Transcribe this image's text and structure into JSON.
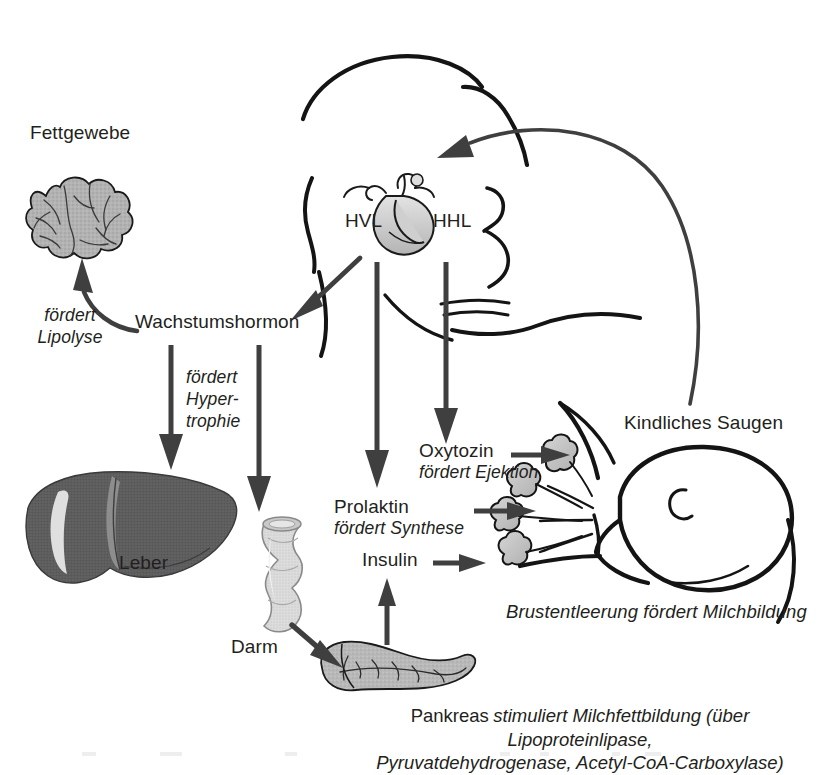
{
  "figure": {
    "kind": "physiology-flow-diagram",
    "language": "de",
    "background_color": "#ffffff",
    "ink_color": "#1a1a1a",
    "arrow_color": "#3f3f3f",
    "fill_light_gray": "#cfcfcf",
    "fill_mid_gray": "#a8a8a8",
    "fill_dark_gray": "#5a5a5a"
  },
  "nodes": {
    "fettgewebe": "Fettgewebe",
    "wachstumshormon": "Wachstumshormon",
    "leber": "Leber",
    "darm": "Darm",
    "pankreas": "Pankreas",
    "insulin": "Insulin",
    "prolaktin": "Prolaktin",
    "oxytozin": "Oxytozin",
    "hvl": "HVL",
    "hhl": "HHL",
    "kindliches_saugen": "Kindliches Saugen"
  },
  "annotations": {
    "foerdert_lipolyse_line1": "fördert",
    "foerdert_lipolyse_line2": "Lipolyse",
    "foerdert_hypertrophie_line1": "fördert",
    "foerdert_hypertrophie_line2": "Hyper-",
    "foerdert_hypertrophie_line3": "trophie",
    "foerdert_ejektion": "fördert Ejektion",
    "foerdert_synthese": "fördert Synthese",
    "brustentleerung": "Brustentleerung fördert Milchbildung"
  },
  "caption": {
    "pankreas_label": "Pankreas",
    "line1": "stimuliert Milchfettbildung (über Lipoproteinlipase,",
    "line2": "Pyruvatdehydrogenase, Acetyl-CoA-Carboxylase)"
  },
  "icons": {
    "adipose": "adipose-tissue-icon",
    "liver": "liver-icon",
    "intestine": "intestine-icon",
    "pancreas": "pancreas-icon",
    "pituitary": "pituitary-gland-icon",
    "mother_head": "mother-head-profile-icon",
    "infant": "infant-head-icon",
    "mammary_lobules": "mammary-lobules-icon"
  },
  "edges": [
    {
      "from": "wachstumshormon",
      "to": "fettgewebe",
      "label": "fördert Lipolyse",
      "style": "curved"
    },
    {
      "from": "wachstumshormon",
      "to": "leber",
      "label": "",
      "style": "straight-down"
    },
    {
      "from": "wachstumshormon",
      "to": "darm",
      "label": "fördert Hypertrophie",
      "style": "straight-down"
    },
    {
      "from": "hvl",
      "to": "prolaktin",
      "label": "",
      "style": "straight-down"
    },
    {
      "from": "hhl",
      "to": "oxytozin",
      "label": "",
      "style": "straight-down"
    },
    {
      "from": "hvl",
      "to": "wachstumshormon",
      "label": "",
      "style": "diagonal"
    },
    {
      "from": "darm",
      "to": "pankreas",
      "label": "",
      "style": "diagonal"
    },
    {
      "from": "pankreas",
      "to": "insulin",
      "label": "",
      "style": "straight-up"
    },
    {
      "from": "oxytozin",
      "to": "mammary_lobules",
      "label": "",
      "style": "straight-right"
    },
    {
      "from": "prolaktin",
      "to": "mammary_lobules",
      "label": "",
      "style": "straight-right"
    },
    {
      "from": "insulin",
      "to": "mammary_lobules",
      "label": "",
      "style": "straight-right"
    },
    {
      "from": "kindliches_saugen",
      "to": "mother_head",
      "label": "",
      "style": "large-feedback-curve"
    }
  ]
}
